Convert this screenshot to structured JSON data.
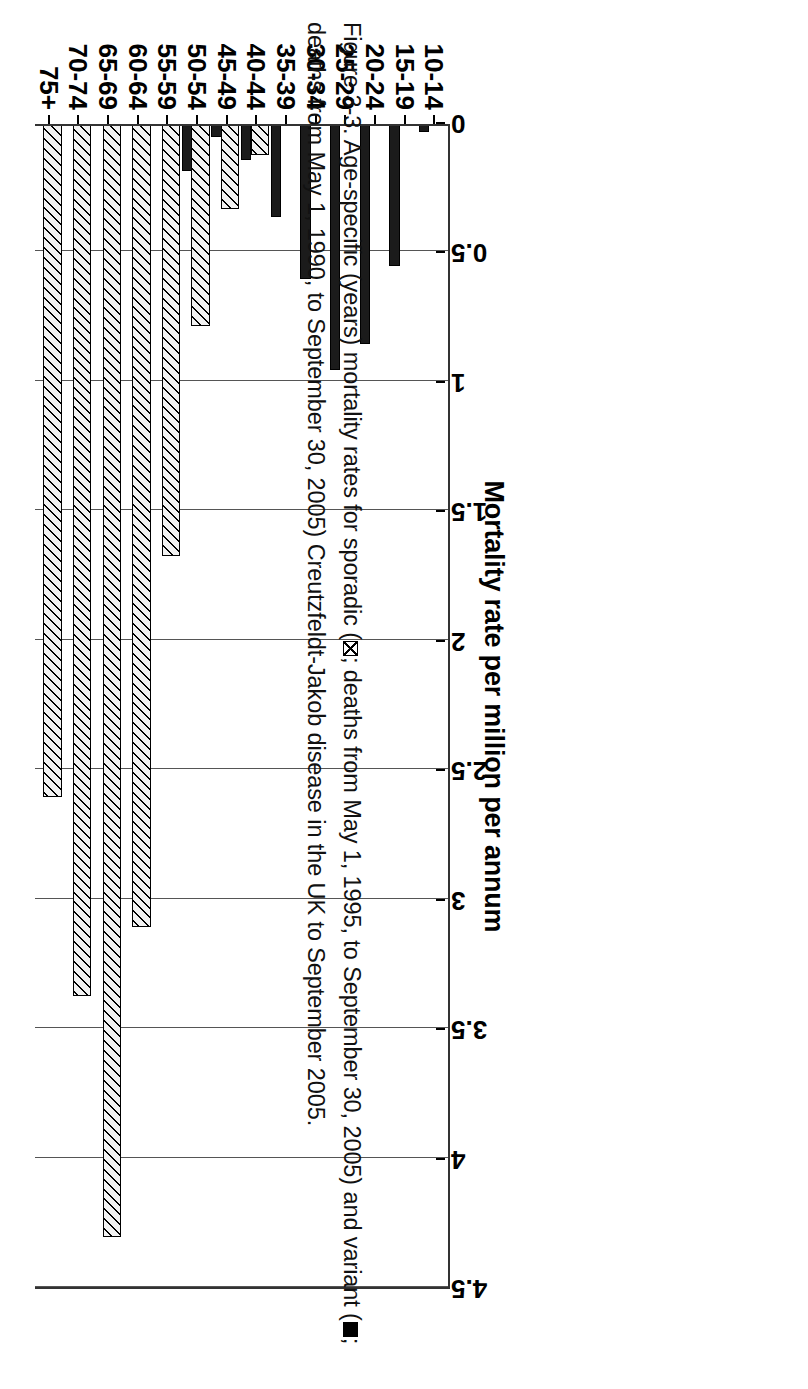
{
  "figure": {
    "caption_part1": "Figure 3-3. Age-specific (years) mortality rates for sporadic (",
    "caption_part2": "; deaths from May 1, 1990, to September 30, 2005) Creutzfeldt-Jakob disease in the UK to September 2005.",
    "caption_mid": "; deaths from May 1, 1995, to September 30, 2005) and variant (",
    "sporadic_swatch_name": "hatched-square",
    "variant_swatch_name": "solid-black-square"
  },
  "chart_data": {
    "type": "bar",
    "title": "",
    "xlabel": "Age range (years)",
    "ylabel": "Mortality rate per million per annum",
    "ylim": [
      0,
      4.5
    ],
    "yticks": [
      "0",
      "0.5",
      "1",
      "1.5",
      "2",
      "2.5",
      "3",
      "3.5",
      "4",
      "4.5"
    ],
    "ytick_values": [
      0,
      0.5,
      1,
      1.5,
      2,
      2.5,
      3,
      3.5,
      4,
      4.5
    ],
    "grid": true,
    "legend_position": "caption",
    "categories": [
      "10-14",
      "15-19",
      "20-24",
      "25-29",
      "30-34",
      "35-39",
      "40-44",
      "45-49",
      "50-54",
      "55-59",
      "60-64",
      "65-69",
      "70-74",
      "75+"
    ],
    "series": [
      {
        "name": "sporadic",
        "fill": "hatched",
        "values": [
          0,
          0,
          0,
          0,
          0,
          0,
          0.12,
          0.33,
          0.78,
          1.67,
          3.1,
          4.3,
          3.37,
          2.6
        ]
      },
      {
        "name": "variant",
        "fill": "solid-black",
        "values": [
          0.03,
          0.55,
          0.85,
          0.95,
          0.6,
          0.36,
          0.14,
          0.05,
          0.18,
          0,
          0,
          0,
          0,
          0
        ]
      }
    ]
  },
  "colors": {
    "axis": "#333333",
    "grid": "#555555",
    "variant_fill": "#1b1b1b",
    "sporadic_fill": "#f2f2f2"
  }
}
